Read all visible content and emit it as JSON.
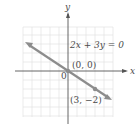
{
  "graph": {
    "equation": "2x + 3y = 0",
    "axis_x_label": "x",
    "axis_y_label": "y",
    "origin_label": "0",
    "points": [
      {
        "label": "(0, 0)",
        "x": 0,
        "y": 0
      },
      {
        "label": "(3, −2)",
        "x": 3,
        "y": -2
      }
    ],
    "colors": {
      "line": "#8c8c8c",
      "grid": "#dcdcdc",
      "axis": "#555555",
      "text": "#4a4a4a"
    }
  }
}
